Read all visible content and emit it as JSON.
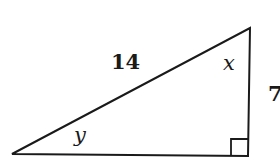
{
  "diagram": {
    "type": "right-triangle",
    "hypotenuse_label": "14",
    "vertical_side_label": "7",
    "top_angle_label": "x",
    "left_angle_label": "y",
    "right_angle_marker": true,
    "colors": {
      "stroke": "#1a1a1a",
      "background": "#ffffff"
    }
  }
}
